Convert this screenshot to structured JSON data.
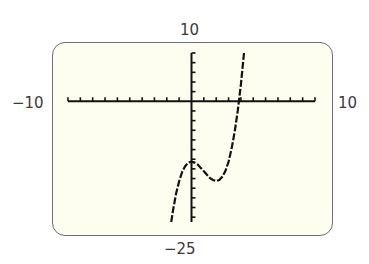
{
  "window": {
    "xmin_label": "−10",
    "xmax_label": "10",
    "ymin_label": "−25",
    "ymax_label": "10"
  },
  "colors": {
    "screen_bg": "#fdfdf0",
    "screen_border": "#6e6e6e",
    "axis": "#111111",
    "curve": "#111111"
  },
  "chart_data": {
    "type": "line",
    "title": "",
    "xlabel": "",
    "ylabel": "",
    "xlim": [
      -10,
      10
    ],
    "ylim": [
      -25,
      10
    ],
    "xscl": 1,
    "yscl": 2,
    "grid": false,
    "legend": null,
    "annotations": [
      "Xmin = -10",
      "Xmax = 10",
      "Ymin = -25",
      "Ymax = 10"
    ],
    "series": [
      {
        "name": "y = x^3 - 3x^2 - 12.5 (approx.)",
        "x": [
          -1.64,
          -1.5,
          -1.25,
          -1.0,
          -0.75,
          -0.5,
          -0.25,
          0.0,
          0.25,
          0.5,
          0.75,
          1.0,
          1.25,
          1.5,
          1.75,
          2.0,
          2.25,
          2.5,
          2.75,
          3.0,
          3.25,
          3.5,
          3.75,
          4.0,
          4.25
        ],
        "y": [
          -25.0,
          -22.6,
          -19.1,
          -16.5,
          -14.6,
          -13.4,
          -12.7,
          -12.5,
          -12.7,
          -13.1,
          -13.8,
          -14.5,
          -15.2,
          -15.9,
          -16.3,
          -16.5,
          -16.3,
          -15.6,
          -14.4,
          -12.5,
          -9.8,
          -6.3,
          -1.9,
          3.5,
          10.0
        ]
      }
    ],
    "key_points": {
      "local_max": [
        0,
        -12.5
      ],
      "local_min": [
        2,
        -16.5
      ],
      "x_intercept": 3.8
    }
  }
}
